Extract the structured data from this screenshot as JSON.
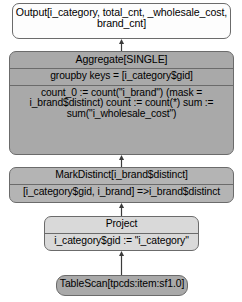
{
  "diagram": {
    "colors": {
      "node_border": "#6b6b6b",
      "fill_white": "#fdfdfd",
      "fill_mid": "#a9a9a9",
      "fill_light": "#d9d9d9",
      "fill_midlight": "#b4b4b4",
      "edge": "#3b3b3b",
      "text": "#000000"
    },
    "nodes": {
      "output": {
        "label": "Output[i_category, total_cnt, _wholesale_cost, brand_cnt]"
      },
      "aggregate": {
        "title": "Aggregate[SINGLE]",
        "groupby": "groupby keys = [i_category$gid]",
        "aggregations": "count_0 := count(\"i_brand\") (mask = i_brand$distinct) count := count(*) sum := sum(\"i_wholesale_cost\")",
        "aggregation_lines": [
          "count_0 := count(\"i_brand\") (mask = i_brand$distinct)",
          "count := count(*)",
          "sum := sum(\"i_wholesale_cost\")"
        ]
      },
      "markdistinct": {
        "title": "MarkDistinct[i_brand$distinct]",
        "body": "[i_category$gid, i_brand] =>i_brand$distinct"
      },
      "project": {
        "title": "Project",
        "body": "i_category$gid := \"i_category\""
      },
      "tablescan": {
        "label": "TableScan[tpcds:item:sf1.0]"
      }
    },
    "edges": [
      {
        "from": "aggregate",
        "to": "output"
      },
      {
        "from": "markdistinct",
        "to": "aggregate"
      },
      {
        "from": "project",
        "to": "markdistinct"
      },
      {
        "from": "tablescan",
        "to": "project"
      }
    ]
  }
}
